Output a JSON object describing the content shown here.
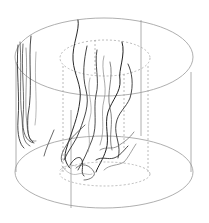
{
  "diagram": {
    "type": "3d-root-system-in-cylinder",
    "colors": {
      "background": "#ffffff",
      "cylinder_outline": "#9a9a9a",
      "inner_dashed": "#a8a8a8",
      "root_dark": "#2a2a2a",
      "root_mid": "#555555",
      "root_light": "#9a9a9a"
    },
    "outer_cylinder": {
      "top_ellipse": {
        "cx": 104,
        "cy": 57,
        "rx": 89,
        "ry": 39
      },
      "bottom_ellipse": {
        "cx": 104,
        "cy": 172,
        "rx": 89,
        "ry": 36
      }
    },
    "inner_cylinder": {
      "top_ellipse": {
        "cx": 105,
        "cy": 58,
        "rx": 45,
        "ry": 18
      },
      "bottom_ellipse": {
        "cx": 105,
        "cy": 172,
        "rx": 45,
        "ry": 12
      }
    }
  }
}
